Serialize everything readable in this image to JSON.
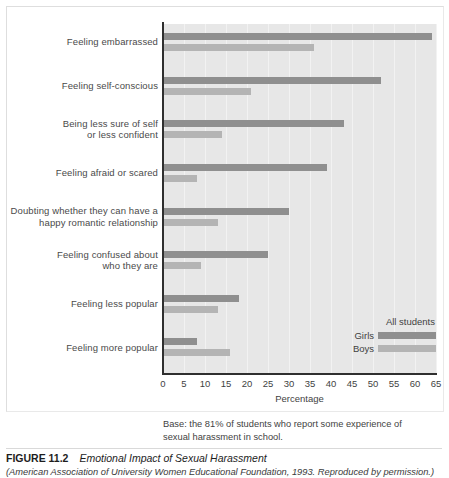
{
  "chart_data": {
    "type": "bar",
    "orientation": "horizontal",
    "title": "Emotional Impact of Sexual Harassment",
    "xlabel": "Percentage",
    "ylabel": "",
    "xlim": [
      0,
      65
    ],
    "xticks": [
      0,
      5,
      10,
      15,
      20,
      25,
      30,
      35,
      40,
      45,
      50,
      55,
      60,
      65
    ],
    "grid": "vertical",
    "legend_position": "inside-lower-right",
    "legend_title": "All students",
    "categories": [
      "Feeling embarrassed",
      "Feeling self-conscious",
      "Being less sure of self\nor less confident",
      "Feeling afraid or scared",
      "Doubting whether they can have a\nhappy romantic relationship",
      "Feeling confused about\nwho they are",
      "Feeling less popular",
      "Feeling more popular"
    ],
    "series": [
      {
        "name": "Girls",
        "color": "#8f8f8f",
        "values": [
          64,
          52,
          43,
          39,
          30,
          25,
          18,
          8
        ]
      },
      {
        "name": "Boys",
        "color": "#b4b4b4",
        "values": [
          36,
          21,
          14,
          8,
          13,
          9,
          13,
          16
        ]
      }
    ],
    "annotation": "Base: the 81% of students who report some experience of sexual harassment in school."
  },
  "axis": {
    "x_label": "Percentage",
    "tick_labels": [
      "0",
      "5",
      "10",
      "15",
      "20",
      "25",
      "30",
      "35",
      "40",
      "45",
      "50",
      "55",
      "60",
      "65"
    ]
  },
  "categories": [
    {
      "line1": "Feeling embarrassed",
      "line2": ""
    },
    {
      "line1": "Feeling self-conscious",
      "line2": ""
    },
    {
      "line1": "Being less sure of self",
      "line2": "or less confident"
    },
    {
      "line1": "Feeling afraid or scared",
      "line2": ""
    },
    {
      "line1": "Doubting whether they can have a",
      "line2": "happy romantic relationship"
    },
    {
      "line1": "Feeling confused about",
      "line2": "who they are"
    },
    {
      "line1": "Feeling less popular",
      "line2": ""
    },
    {
      "line1": "Feeling more popular",
      "line2": ""
    }
  ],
  "legend": {
    "title": "All students",
    "items": [
      {
        "label": "Girls",
        "color": "#8f8f8f"
      },
      {
        "label": "Boys",
        "color": "#b4b4b4"
      }
    ]
  },
  "base_note": {
    "line1": "Base: the 81% of students who report some experience of",
    "line2": "sexual harassment in school."
  },
  "caption": {
    "figure_number": "FIGURE 11.2",
    "title": "Emotional Impact of Sexual Harassment",
    "source": "(American Association of University Women Educational Foundation, 1993. Reproduced by permission.)"
  }
}
